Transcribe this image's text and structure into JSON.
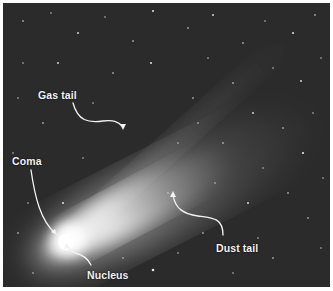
{
  "figure": {
    "labels": {
      "gas_tail": "Gas tail",
      "coma": "Coma",
      "nucleus": "Nucleus",
      "dust_tail": "Dust tail"
    },
    "colors": {
      "sky": "#2b2b2b",
      "label": "#f2f2f2",
      "border": "#ffffff"
    }
  }
}
